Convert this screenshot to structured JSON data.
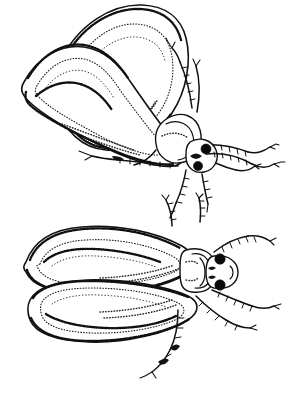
{
  "figure": {
    "title": "Two insect specimens, pen-and-ink line drawing",
    "medium": "black ink line and stipple drawing on white background",
    "background_color": "#ffffff",
    "ink_color": "#111111",
    "width_px": 305,
    "height_px": 403,
    "specimen_count": 2,
    "caption": "",
    "labels": []
  },
  "specimens": [
    {
      "id": "upper-specimen",
      "name": "upper-insect",
      "view": "oblique dorso-lateral view, head toward lower right",
      "orientation_degrees": -30,
      "parts": {
        "left_elytron": "elongate teardrop forewing, outer, stippled margins",
        "right_elytron": "elongate teardrop forewing, inner, stippled margins",
        "pronotum": "rounded shield behind head",
        "head": "small, with two dark rounded eyes",
        "eyes": 2,
        "antennae": 2,
        "legs": 6
      }
    },
    {
      "id": "lower-specimen",
      "name": "lower-insect",
      "view": "dorsal view, head toward right",
      "orientation_degrees": 0,
      "parts": {
        "left_elytron": "upper broad teardrop forewing with stippled inner outline",
        "right_elytron": "lower broad teardrop forewing with stippled inner outline",
        "pronotum": "rectangular plate with central ridge",
        "head": "rounded, bearing two dark eyes",
        "eyes": 2,
        "antennae": 2,
        "legs": 6
      }
    }
  ],
  "colors": {
    "ink": "#111111",
    "stipple": "#1a1a1a",
    "paper": "#ffffff",
    "eye": "#0a0a0a"
  }
}
